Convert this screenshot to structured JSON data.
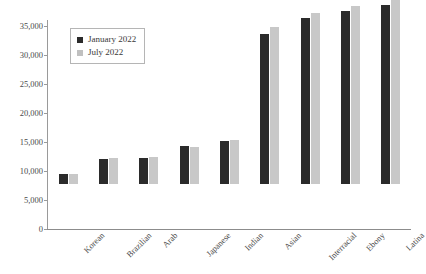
{
  "chart_data": {
    "type": "bar",
    "title": "",
    "subtitle": "",
    "xlabel": "",
    "ylabel": "",
    "ylim": [
      0,
      35000
    ],
    "ytick_labels": [
      "0",
      "5,000",
      "10,000",
      "15,000",
      "20,000",
      "25,000",
      "30,000",
      "35,000"
    ],
    "ytick_values": [
      0,
      5000,
      10000,
      15000,
      20000,
      25000,
      30000,
      35000
    ],
    "grid": false,
    "legend_position": "upper left inside plot",
    "categories": [
      "Korean",
      "Brazilian",
      "Arab",
      "Japanese",
      "Indian",
      "Asian",
      "Interracial",
      "Ebony",
      "Latina"
    ],
    "series": [
      {
        "name": "January 2022",
        "color": "#2b2b2b",
        "values": [
          1700,
          4300,
          4500,
          6600,
          7400,
          25800,
          28700,
          29800,
          30900
        ]
      },
      {
        "name": "July 2022",
        "color": "#c8c8c8",
        "values": [
          1700,
          4400,
          4700,
          6400,
          7600,
          27100,
          29500,
          30700,
          32100
        ]
      }
    ]
  },
  "legend": {
    "entries": [
      {
        "label": "January 2022",
        "swatch": "january-swatch"
      },
      {
        "label": "July 2022",
        "swatch": "july-swatch"
      }
    ]
  }
}
